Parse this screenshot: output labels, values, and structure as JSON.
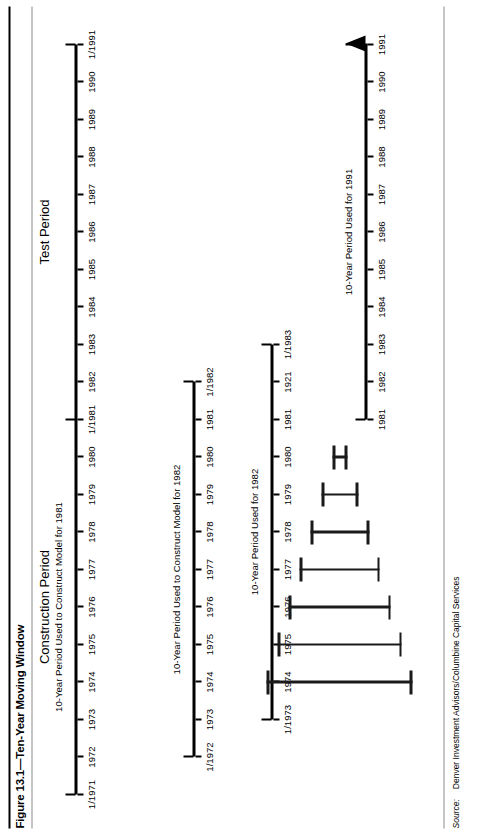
{
  "figure": {
    "title": "Figure 13.1—Ten-Year Moving Window",
    "source_label": "Source:",
    "source_text": "Denver Investment Advisors/Columbine Capital Services"
  },
  "headings": {
    "construction_period": "Construction Period",
    "test_period": "Test Period"
  },
  "colors": {
    "ink": "#000000",
    "rule": "#8c8c8c",
    "bar": "#1a1a1a",
    "background": "#ffffff"
  },
  "chart_data": {
    "type": "timeline",
    "title": "Figure 13.1—Ten-Year Moving Window",
    "xlabel": "",
    "ylabel": "",
    "grid": false,
    "legend": "none",
    "axis_range": [
      1971,
      1991
    ],
    "annotations": [
      "Construction Period",
      "Test Period"
    ],
    "timelines": [
      {
        "id": "row-1",
        "caption": "10-Year Period Used to Construct Model for 1981",
        "caption_at": 1976,
        "start": 1971,
        "end": 1991,
        "ticks": [
          1971,
          1972,
          1973,
          1974,
          1975,
          1976,
          1977,
          1978,
          1979,
          1980,
          1981,
          1982,
          1983,
          1984,
          1985,
          1986,
          1987,
          1988,
          1989,
          1990,
          1991
        ],
        "labels": [
          "1/1971",
          "1972",
          "1973",
          "1974",
          "1975",
          "1976",
          "1977",
          "1978",
          "1979",
          "1980",
          "1/1981",
          "1982",
          "1983",
          "1984",
          "1985",
          "1986",
          "1987",
          "1988",
          "1989",
          "1990",
          "1/1991"
        ],
        "caps": [
          1971,
          1981,
          1991
        ],
        "arrow": false
      },
      {
        "id": "row-2",
        "caption": "10-Year Period Used to Construct Model for 1982",
        "caption_at": 1977,
        "start": 1972,
        "end": 1982,
        "ticks": [
          1972,
          1973,
          1974,
          1975,
          1976,
          1977,
          1978,
          1979,
          1980,
          1981,
          1982
        ],
        "labels": [
          "1/1972",
          "1973",
          "1974",
          "1975",
          "1976",
          "1977",
          "1978",
          "1979",
          "1980",
          "1981",
          "1/1982"
        ],
        "caps": [
          1972,
          1982
        ],
        "arrow": false
      },
      {
        "id": "row-3",
        "caption": "10-Year Period Used for 1982",
        "caption_at": 1978,
        "start": 1973,
        "end": 1983,
        "ticks": [
          1973,
          1974,
          1975,
          1976,
          1977,
          1978,
          1979,
          1980,
          1981,
          1982,
          1983
        ],
        "labels": [
          "1/1973",
          "1974",
          "1975",
          "1976",
          "1977",
          "1978",
          "1979",
          "1980",
          "1981",
          "1921",
          "1/1983"
        ],
        "caps": [
          1973,
          1983
        ],
        "arrow": false
      },
      {
        "id": "row-last",
        "caption": "10-Year Period Used for 1991",
        "caption_at": 1986,
        "start": 1981,
        "end": 1991,
        "ticks": [
          1981,
          1982,
          1983,
          1984,
          1985,
          1986,
          1987,
          1988,
          1989,
          1990,
          1991
        ],
        "labels": [
          "1981",
          "1982",
          "1983",
          "1984",
          "1985",
          "1986",
          "1987",
          "1988",
          "1989",
          "1990",
          "1991"
        ],
        "caps": [
          1981
        ],
        "arrow": true
      }
    ],
    "staircase_bars": [
      {
        "id": "bar-1",
        "at": 1974
      },
      {
        "id": "bar-2",
        "at": 1975
      },
      {
        "id": "bar-3",
        "at": 1976
      },
      {
        "id": "bar-4",
        "at": 1977
      },
      {
        "id": "bar-5",
        "at": 1978
      },
      {
        "id": "bar-6",
        "at": 1979
      },
      {
        "id": "bar-7",
        "at": 1980
      }
    ]
  }
}
